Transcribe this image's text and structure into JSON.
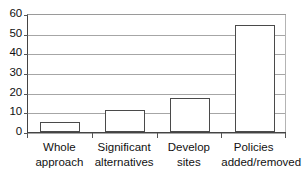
{
  "chart_data": {
    "type": "bar",
    "title": "",
    "subtitle": "",
    "xlabel": "",
    "ylabel": "",
    "categories": [
      "Whole approach",
      "Significant alternatives",
      "Develop sites",
      "Policies added/removed"
    ],
    "category_lines": [
      [
        "Whole",
        "approach"
      ],
      [
        "Significant",
        "alternatives"
      ],
      [
        "Develop",
        "sites"
      ],
      [
        "Policies",
        "added/removed"
      ]
    ],
    "values": [
      5,
      11,
      17.5,
      54.5
    ],
    "ylim": [
      0,
      60
    ],
    "yticks": [
      0,
      10,
      20,
      30,
      40,
      50,
      60
    ],
    "ytick_labels": [
      "0",
      "10",
      "20",
      "30",
      "40",
      "50",
      "60"
    ],
    "grid": true,
    "grid_axis": "y",
    "legend": false,
    "legend_position": "none",
    "bar_fill_color": "#ffffff",
    "bar_edge_color": "#4a4a4a",
    "gridline_color": "#a6a6a6",
    "axis_color": "#444444",
    "background_color": "#ffffff"
  }
}
